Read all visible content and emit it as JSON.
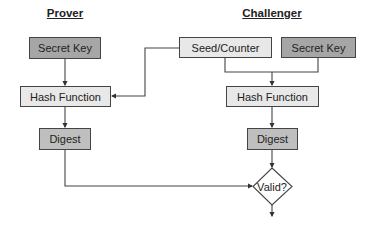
{
  "prover": {
    "title": "Prover",
    "secret_key": "Secret Key",
    "hash_function": "Hash Function",
    "digest": "Digest"
  },
  "challenger": {
    "title": "Challenger",
    "seed_counter": "Seed/Counter",
    "secret_key": "Secret Key",
    "hash_function": "Hash Function",
    "digest": "Digest",
    "decision": "Valid?"
  },
  "colors": {
    "secret_key_fill": "#a6a6a6",
    "process_fill": "#e8e8e8",
    "digest_fill": "#bfbfbf",
    "line": "#444444"
  }
}
